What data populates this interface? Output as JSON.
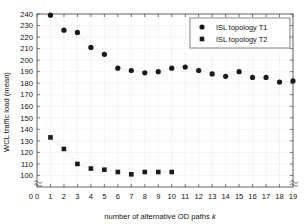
{
  "chart_data": {
    "type": "scatter",
    "title": "",
    "xlabel": "number of alternative OD paths k",
    "xlabel_main": "number of alternative OD paths ",
    "xlabel_italic": "k",
    "ylabel": "WCL traffic load (mean)",
    "xlim": [
      0,
      19
    ],
    "ylim": [
      90,
      240
    ],
    "y_axis_break": true,
    "y_break_label": "0",
    "grid": true,
    "legend_position": "top-right",
    "xticks": [
      0,
      1,
      2,
      3,
      4,
      5,
      6,
      7,
      8,
      9,
      10,
      11,
      12,
      13,
      14,
      15,
      16,
      17,
      18,
      19
    ],
    "yticks": [
      100,
      110,
      120,
      130,
      140,
      150,
      160,
      170,
      180,
      190,
      200,
      210,
      220,
      230,
      240
    ],
    "marker_color": "#1a1a1a",
    "grid_color": "#c8c8c8",
    "axis_color": "#555555",
    "series": [
      {
        "name": "ISL topology T1",
        "marker": "circle",
        "x": [
          1,
          2,
          3,
          4,
          5,
          6,
          7,
          8,
          9,
          10,
          11,
          12,
          13,
          14,
          15,
          16,
          17,
          18,
          19
        ],
        "values": [
          239,
          226,
          224,
          211,
          205,
          193,
          191,
          189,
          190,
          193,
          194,
          191,
          188,
          186,
          190,
          185,
          185,
          181,
          182
        ]
      },
      {
        "name": "ISL topology T2",
        "marker": "square",
        "x": [
          1,
          2,
          3,
          4,
          5,
          6,
          7,
          8,
          9,
          10
        ],
        "values": [
          133,
          123,
          110,
          106,
          105,
          103,
          101,
          103,
          103,
          103
        ]
      }
    ]
  },
  "legend": {
    "entries": [
      {
        "label": "ISL topology T1",
        "marker": "circle"
      },
      {
        "label": "ISL topology T2",
        "marker": "square"
      }
    ]
  }
}
